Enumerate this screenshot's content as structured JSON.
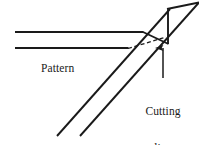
{
  "figure": {
    "background_color": "#ffffff",
    "stroke_color": "#1a1a1a",
    "text_color": "#1a1a1a",
    "width": 199,
    "height": 145,
    "labels": {
      "pattern": "Pattern",
      "cutting_line_row1": "Cutting",
      "cutting_line_row2": "line"
    },
    "strokes": {
      "solid_width": 1.9,
      "dashed_width": 1.3,
      "dash_pattern": "4,2.6",
      "arrow_width": 1.5
    },
    "geometry": {
      "pattern_edge_top": {
        "x1": 15,
        "y1": 32,
        "x2": 143,
        "y2": 32
      },
      "pattern_edge_bottom": {
        "x1": 15,
        "y1": 48,
        "x2": 128,
        "y2": 48
      },
      "fold_diagonal_upper": {
        "x1": 57,
        "y1": 136,
        "x2": 170,
        "y2": 9
      },
      "fold_diagonal_lower": {
        "x1": 80,
        "y1": 136,
        "x2": 199,
        "y2": 9
      },
      "flap_vertical": {
        "x1": 168,
        "y1": 10,
        "x2": 168,
        "y2": 44
      },
      "flap_top_edge": {
        "x1": 168,
        "y1": 9,
        "x2": 199,
        "y2": 3
      },
      "flap_lower_edge": {
        "x1": 143,
        "y1": 32,
        "x2": 168,
        "y2": 44
      },
      "cutting_line_dashed": {
        "x1": 128,
        "y1": 48,
        "x2": 166,
        "y2": 37
      },
      "callout_arrow": {
        "x1": 163,
        "y1": 78,
        "x2": 163,
        "y2": 47
      }
    }
  }
}
